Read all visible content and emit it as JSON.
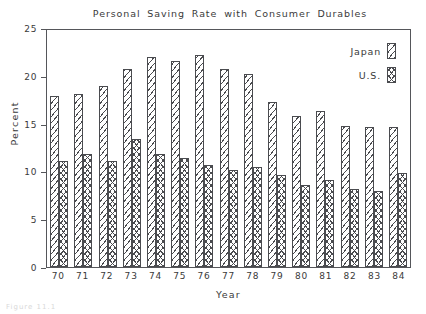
{
  "chart_data": {
    "type": "bar",
    "title": "Personal Saving Rate with Consumer Durables",
    "xlabel": "Year",
    "ylabel": "Percent",
    "categories": [
      "70",
      "71",
      "72",
      "73",
      "74",
      "75",
      "76",
      "77",
      "78",
      "79",
      "80",
      "81",
      "82",
      "83",
      "84"
    ],
    "ylim": [
      0,
      25
    ],
    "yticks": [
      0,
      5,
      10,
      15,
      20,
      25
    ],
    "ytick_labels": [
      "0",
      "5",
      "10",
      "15",
      "20",
      "25"
    ],
    "grid": false,
    "legend_position": "top-right",
    "series": [
      {
        "name": "Japan",
        "pattern": "diagonal-hatch",
        "values": [
          17.9,
          18.1,
          18.9,
          20.7,
          22.0,
          21.5,
          22.2,
          20.7,
          20.2,
          17.3,
          15.8,
          16.3,
          14.8,
          14.6,
          14.6
        ]
      },
      {
        "name": "U.S.",
        "pattern": "cross-hatch",
        "values": [
          11.1,
          11.8,
          11.1,
          13.4,
          11.8,
          11.4,
          10.7,
          10.2,
          10.5,
          9.6,
          8.6,
          9.1,
          8.2,
          8.0,
          9.8
        ]
      }
    ]
  },
  "legend": {
    "items": [
      {
        "label": "Japan"
      },
      {
        "label": "U.S."
      }
    ]
  },
  "artifact": {
    "text": "Figure 11.1"
  }
}
